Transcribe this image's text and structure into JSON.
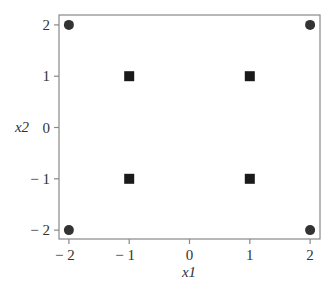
{
  "chart_data": {
    "type": "scatter",
    "title": "",
    "xlabel": "x1",
    "ylabel": "x2",
    "xlim": [
      -2.15,
      2.15
    ],
    "ylim": [
      -2.2,
      2.2
    ],
    "xticks": [
      -2,
      -1,
      0,
      1,
      2
    ],
    "yticks": [
      -2,
      -1,
      0,
      1,
      2
    ],
    "xtick_labels": [
      "− 2",
      "− 1",
      "0",
      "1",
      "2"
    ],
    "ytick_labels": [
      "− 2",
      "− 1",
      "0",
      "1",
      "2"
    ],
    "grid": false,
    "legend": null,
    "series": [
      {
        "name": "circles",
        "marker": "circle",
        "color": "#333333",
        "points": [
          [
            -2,
            2
          ],
          [
            2,
            2
          ],
          [
            -2,
            -2
          ],
          [
            2,
            -2
          ]
        ]
      },
      {
        "name": "squares",
        "marker": "square",
        "color": "#1a1a1a",
        "points": [
          [
            -1,
            1
          ],
          [
            1,
            1
          ],
          [
            -1,
            -1
          ],
          [
            1,
            -1
          ]
        ]
      }
    ]
  },
  "colors": {
    "frame": "#888888",
    "text": "#333333"
  }
}
